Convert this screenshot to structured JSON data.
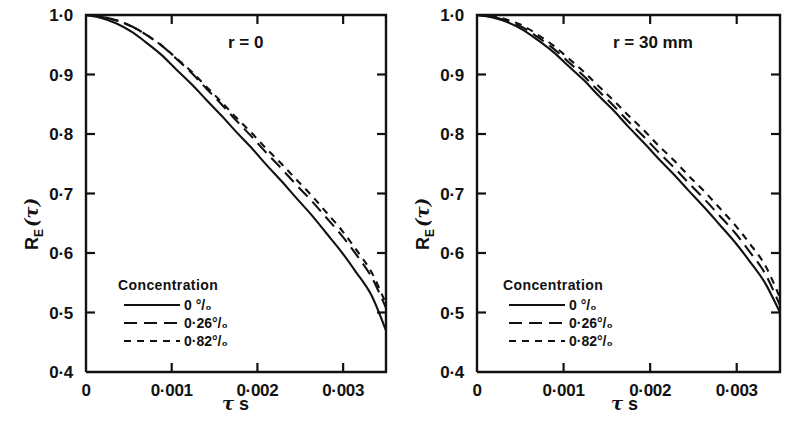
{
  "figure": {
    "background": "#ffffff",
    "ink": "#111111"
  },
  "chart_data": [
    {
      "type": "line",
      "title": "r = 0",
      "panel": "left",
      "xlabel": "τ s",
      "ylabel": "R_E(τ)",
      "xlim": [
        0,
        0.0035
      ],
      "ylim": [
        0.4,
        1.0
      ],
      "xticks": [
        0,
        0.001,
        0.002,
        0.003
      ],
      "xtick_labels": [
        "0",
        "0·001",
        "0·002",
        "0·003"
      ],
      "yticks": [
        0.4,
        0.5,
        0.6,
        0.7,
        0.8,
        0.9,
        1.0
      ],
      "ytick_labels": [
        "0·4",
        "0·5",
        "0·6",
        "0·7",
        "0·8",
        "0·9",
        "1·0"
      ],
      "grid": false,
      "legend_position": "lower-left-inside",
      "legend_title": "Concentration",
      "series": [
        {
          "name": "0 °/₀",
          "style": "solid",
          "x": [
            0,
            0.00018,
            0.00035,
            0.00053,
            0.0007,
            0.00088,
            0.00105,
            0.00123,
            0.0014,
            0.00158,
            0.00175,
            0.00193,
            0.0021,
            0.00228,
            0.00245,
            0.00263,
            0.0028,
            0.00298,
            0.00315,
            0.00333,
            0.0035
          ],
          "y": [
            1.0,
            0.995,
            0.986,
            0.972,
            0.954,
            0.933,
            0.909,
            0.884,
            0.858,
            0.831,
            0.804,
            0.777,
            0.749,
            0.721,
            0.693,
            0.664,
            0.634,
            0.602,
            0.568,
            0.529,
            0.47
          ]
        },
        {
          "name": "0·26 °/₀",
          "style": "dashed-long",
          "x": [
            0,
            0.00018,
            0.00035,
            0.00053,
            0.0007,
            0.00088,
            0.00105,
            0.00123,
            0.0014,
            0.00158,
            0.00175,
            0.00193,
            0.0021,
            0.00228,
            0.00245,
            0.00263,
            0.0028,
            0.00298,
            0.00315,
            0.00333,
            0.0035
          ],
          "y": [
            1.0,
            0.997,
            0.991,
            0.981,
            0.967,
            0.949,
            0.927,
            0.903,
            0.877,
            0.85,
            0.823,
            0.796,
            0.769,
            0.742,
            0.715,
            0.688,
            0.66,
            0.63,
            0.598,
            0.56,
            0.508
          ]
        },
        {
          "name": "0·82 °/₀",
          "style": "dashed-short",
          "x": [
            0,
            0.00018,
            0.00035,
            0.00053,
            0.0007,
            0.00088,
            0.00105,
            0.00123,
            0.0014,
            0.00158,
            0.00175,
            0.00193,
            0.0021,
            0.00228,
            0.00245,
            0.00263,
            0.0028,
            0.00298,
            0.00315,
            0.00333,
            0.0035
          ],
          "y": [
            1.0,
            0.997,
            0.991,
            0.981,
            0.967,
            0.949,
            0.928,
            0.905,
            0.88,
            0.854,
            0.828,
            0.802,
            0.776,
            0.75,
            0.724,
            0.697,
            0.669,
            0.639,
            0.606,
            0.568,
            0.515
          ]
        }
      ]
    },
    {
      "type": "line",
      "title": "r = 30 mm",
      "panel": "right",
      "xlabel": "τ s",
      "ylabel": "R_E(τ)",
      "xlim": [
        0,
        0.0035
      ],
      "ylim": [
        0.4,
        1.0
      ],
      "xticks": [
        0,
        0.001,
        0.002,
        0.003
      ],
      "xtick_labels": [
        "0",
        "0·001",
        "0·002",
        "0·003"
      ],
      "yticks": [
        0.4,
        0.5,
        0.6,
        0.7,
        0.8,
        0.9,
        1.0
      ],
      "ytick_labels": [
        "0·4",
        "0·5",
        "0·6",
        "0·7",
        "0·8",
        "0·9",
        "1·0"
      ],
      "grid": false,
      "legend_position": "lower-left-inside",
      "legend_title": "Concentration",
      "series": [
        {
          "name": "0 °/₀",
          "style": "solid",
          "x": [
            0,
            0.00018,
            0.00035,
            0.00053,
            0.0007,
            0.00088,
            0.00105,
            0.00123,
            0.0014,
            0.00158,
            0.00175,
            0.00193,
            0.0021,
            0.00228,
            0.00245,
            0.00263,
            0.0028,
            0.00298,
            0.00315,
            0.00333,
            0.0035
          ],
          "y": [
            1.0,
            0.996,
            0.988,
            0.975,
            0.958,
            0.938,
            0.915,
            0.891,
            0.865,
            0.839,
            0.812,
            0.785,
            0.758,
            0.731,
            0.704,
            0.676,
            0.648,
            0.618,
            0.586,
            0.549,
            0.5
          ]
        },
        {
          "name": "0·26 °/₀",
          "style": "dashed-long",
          "x": [
            0,
            0.00018,
            0.00035,
            0.00053,
            0.0007,
            0.00088,
            0.00105,
            0.00123,
            0.0014,
            0.00158,
            0.00175,
            0.00193,
            0.0021,
            0.00228,
            0.00245,
            0.00263,
            0.0028,
            0.00298,
            0.00315,
            0.00333,
            0.0035
          ],
          "y": [
            1.0,
            0.997,
            0.99,
            0.979,
            0.963,
            0.944,
            0.922,
            0.898,
            0.873,
            0.847,
            0.821,
            0.795,
            0.769,
            0.743,
            0.717,
            0.69,
            0.663,
            0.634,
            0.602,
            0.565,
            0.512
          ]
        },
        {
          "name": "0·82 °/₀",
          "style": "dashed-short",
          "x": [
            0,
            0.00018,
            0.00035,
            0.00053,
            0.0007,
            0.00088,
            0.00105,
            0.00123,
            0.0014,
            0.00158,
            0.00175,
            0.00193,
            0.0021,
            0.00228,
            0.00245,
            0.00263,
            0.0028,
            0.00298,
            0.00315,
            0.00333,
            0.0035
          ],
          "y": [
            1.0,
            0.998,
            0.992,
            0.982,
            0.967,
            0.949,
            0.928,
            0.905,
            0.881,
            0.856,
            0.831,
            0.806,
            0.78,
            0.755,
            0.729,
            0.703,
            0.676,
            0.647,
            0.616,
            0.579,
            0.525
          ]
        }
      ]
    }
  ],
  "panels": {
    "left": {
      "title": "r = 0",
      "ylabel_main": "R",
      "ylabel_sub": "E",
      "ylabel_tau": "(τ)",
      "xlabel_tau": "τ",
      "xlabel_unit": "s",
      "xtick_labels": [
        "0",
        "0·001",
        "0·002",
        "0·003"
      ],
      "ytick_labels": [
        "1·0",
        "0·9",
        "0·8",
        "0·7",
        "0·6",
        "0·5",
        "0·4"
      ],
      "legend": {
        "title": "Concentration",
        "items": [
          {
            "label": "0 °/₀",
            "style": "solid"
          },
          {
            "label": "0·26°/₀",
            "style": "dashed-long"
          },
          {
            "label": "0·82°/₀",
            "style": "dashed-short"
          }
        ]
      }
    },
    "right": {
      "title": "r = 30 mm",
      "ylabel_main": "R",
      "ylabel_sub": "E",
      "ylabel_tau": "(τ)",
      "xlabel_tau": "τ",
      "xlabel_unit": "s",
      "xtick_labels": [
        "0",
        "0·001",
        "0·002",
        "0·003"
      ],
      "ytick_labels": [
        "1·0",
        "0·9",
        "0·8",
        "0·7",
        "0·6",
        "0·5",
        "0·4"
      ],
      "legend": {
        "title": "Concentration",
        "items": [
          {
            "label": "0 °/₀",
            "style": "solid"
          },
          {
            "label": "0·26°/₀",
            "style": "dashed-long"
          },
          {
            "label": "0·82°/₀",
            "style": "dashed-short"
          }
        ]
      }
    }
  }
}
